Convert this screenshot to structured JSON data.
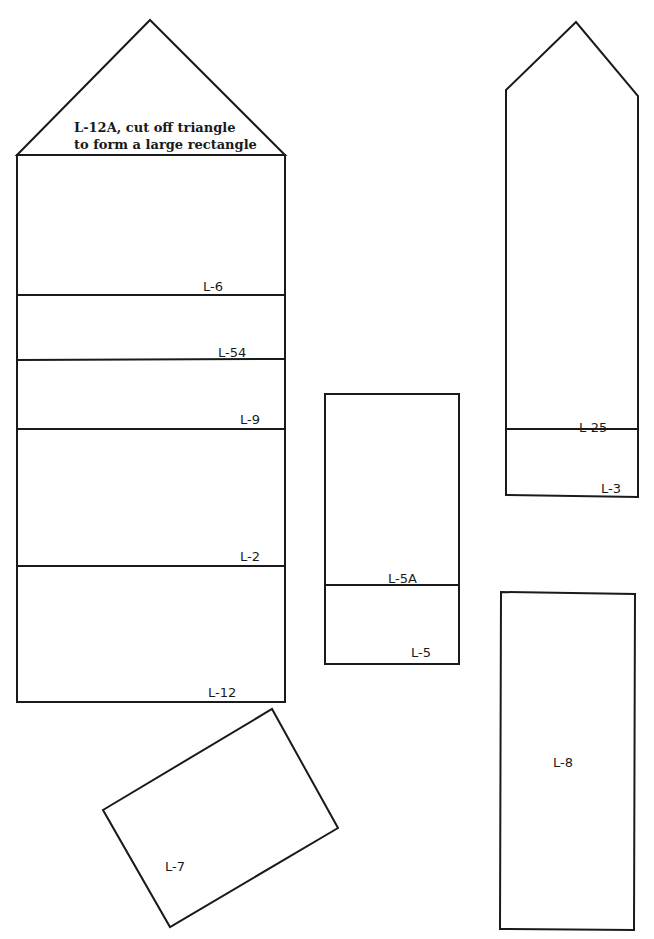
{
  "diagram": {
    "pieces": {
      "l12a_note_line1": "L-12A, cut off triangle",
      "l12a_note_line2": "to form a large rectangle",
      "left_strip_labels": [
        "L-6",
        "L-54",
        "L-9",
        "L-2",
        "L-12"
      ],
      "middle_strip_labels": [
        "L-5A",
        "L-5"
      ],
      "right_pointed_labels": [
        "L-25",
        "L-3"
      ],
      "tall_rectangle_label": "L-8",
      "tilted_rectangle_label": "L-7"
    },
    "line_color": "#1a1a1a",
    "background": "#ffffff"
  }
}
